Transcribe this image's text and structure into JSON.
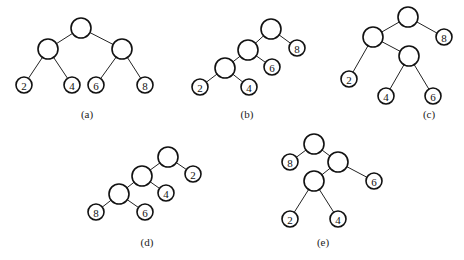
{
  "trees": [
    {
      "caption": "(a)",
      "caption_pos": [
        87,
        118
      ],
      "nodes": [
        {
          "id": "r",
          "x": 81,
          "y": 28,
          "r": 10,
          "label": ""
        },
        {
          "id": "l",
          "x": 48,
          "y": 49,
          "r": 10,
          "label": ""
        },
        {
          "id": "rr",
          "x": 122,
          "y": 49,
          "r": 10,
          "label": ""
        },
        {
          "id": "n2",
          "x": 24,
          "y": 85,
          "r": 8,
          "label": "2"
        },
        {
          "id": "n4",
          "x": 72,
          "y": 85,
          "r": 8,
          "label": "4"
        },
        {
          "id": "n6",
          "x": 96,
          "y": 85,
          "r": 8,
          "label": "6"
        },
        {
          "id": "n8",
          "x": 145,
          "y": 85,
          "r": 8,
          "label": "8"
        }
      ],
      "edges": [
        [
          "r",
          "l"
        ],
        [
          "r",
          "rr"
        ],
        [
          "l",
          "n2"
        ],
        [
          "l",
          "n4"
        ],
        [
          "rr",
          "n6"
        ],
        [
          "rr",
          "n8"
        ]
      ]
    },
    {
      "caption": "(b)",
      "caption_pos": [
        247,
        118
      ],
      "nodes": [
        {
          "id": "r",
          "x": 271,
          "y": 29,
          "r": 10,
          "label": ""
        },
        {
          "id": "a",
          "x": 248,
          "y": 50,
          "r": 10,
          "label": ""
        },
        {
          "id": "n8",
          "x": 297,
          "y": 48,
          "r": 8,
          "label": "8"
        },
        {
          "id": "b",
          "x": 225,
          "y": 68,
          "r": 10,
          "label": ""
        },
        {
          "id": "n6",
          "x": 272,
          "y": 67,
          "r": 8,
          "label": "6"
        },
        {
          "id": "n2",
          "x": 200,
          "y": 87,
          "r": 8,
          "label": "2"
        },
        {
          "id": "n4",
          "x": 249,
          "y": 87,
          "r": 8,
          "label": "4"
        }
      ],
      "edges": [
        [
          "r",
          "a"
        ],
        [
          "r",
          "n8"
        ],
        [
          "a",
          "b"
        ],
        [
          "a",
          "n6"
        ],
        [
          "b",
          "n2"
        ],
        [
          "b",
          "n4"
        ]
      ]
    },
    {
      "caption": "(c)",
      "caption_pos": [
        429,
        118
      ],
      "nodes": [
        {
          "id": "r",
          "x": 408,
          "y": 17,
          "r": 10,
          "label": ""
        },
        {
          "id": "a",
          "x": 373,
          "y": 37,
          "r": 10,
          "label": ""
        },
        {
          "id": "n8",
          "x": 444,
          "y": 37,
          "r": 8,
          "label": "8"
        },
        {
          "id": "b",
          "x": 409,
          "y": 56,
          "r": 10,
          "label": ""
        },
        {
          "id": "n2",
          "x": 349,
          "y": 79,
          "r": 8,
          "label": "2"
        },
        {
          "id": "n4",
          "x": 386,
          "y": 96,
          "r": 8,
          "label": "4"
        },
        {
          "id": "n6",
          "x": 433,
          "y": 96,
          "r": 8,
          "label": "6"
        }
      ],
      "edges": [
        [
          "r",
          "a"
        ],
        [
          "r",
          "n8"
        ],
        [
          "a",
          "n2"
        ],
        [
          "a",
          "b"
        ],
        [
          "b",
          "n4"
        ],
        [
          "b",
          "n6"
        ]
      ]
    },
    {
      "caption": "(d)",
      "caption_pos": [
        147,
        246
      ],
      "nodes": [
        {
          "id": "r",
          "x": 168,
          "y": 157,
          "r": 10,
          "label": ""
        },
        {
          "id": "a",
          "x": 142,
          "y": 176,
          "r": 10,
          "label": ""
        },
        {
          "id": "n2",
          "x": 193,
          "y": 174,
          "r": 8,
          "label": "2"
        },
        {
          "id": "b",
          "x": 119,
          "y": 194,
          "r": 10,
          "label": ""
        },
        {
          "id": "n4",
          "x": 166,
          "y": 193,
          "r": 8,
          "label": "4"
        },
        {
          "id": "n8",
          "x": 96,
          "y": 212,
          "r": 8,
          "label": "8"
        },
        {
          "id": "n6",
          "x": 145,
          "y": 212,
          "r": 8,
          "label": "6"
        }
      ],
      "edges": [
        [
          "r",
          "a"
        ],
        [
          "r",
          "n2"
        ],
        [
          "a",
          "b"
        ],
        [
          "a",
          "n4"
        ],
        [
          "b",
          "n8"
        ],
        [
          "b",
          "n6"
        ]
      ]
    },
    {
      "caption": "(e)",
      "caption_pos": [
        323,
        246
      ],
      "nodes": [
        {
          "id": "r",
          "x": 314,
          "y": 144,
          "r": 10,
          "label": ""
        },
        {
          "id": "n8",
          "x": 290,
          "y": 162,
          "r": 8,
          "label": "8"
        },
        {
          "id": "a",
          "x": 338,
          "y": 162,
          "r": 10,
          "label": ""
        },
        {
          "id": "b",
          "x": 314,
          "y": 181,
          "r": 10,
          "label": ""
        },
        {
          "id": "n6",
          "x": 374,
          "y": 181,
          "r": 8,
          "label": "6"
        },
        {
          "id": "n2",
          "x": 290,
          "y": 219,
          "r": 8,
          "label": "2"
        },
        {
          "id": "n4",
          "x": 338,
          "y": 219,
          "r": 8,
          "label": "4"
        }
      ],
      "edges": [
        [
          "r",
          "n8"
        ],
        [
          "r",
          "a"
        ],
        [
          "a",
          "b"
        ],
        [
          "a",
          "n6"
        ],
        [
          "b",
          "n2"
        ],
        [
          "b",
          "n4"
        ]
      ]
    }
  ]
}
